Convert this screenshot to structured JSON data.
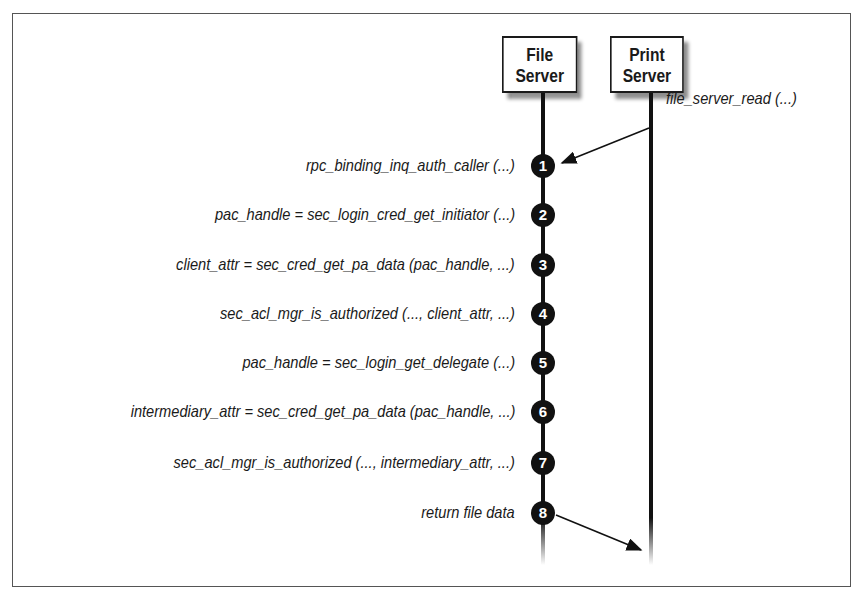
{
  "diagram": {
    "participants": [
      {
        "id": "file_server",
        "line1": "File",
        "line2": "Server"
      },
      {
        "id": "print_server",
        "line1": "Print",
        "line2": "Server"
      }
    ],
    "incoming_message": {
      "label": "file_server_read (...)",
      "from": "print_server",
      "to": "file_server",
      "step": 1
    },
    "steps": [
      {
        "number": "1",
        "label": "rpc_binding_inq_auth_caller (...)"
      },
      {
        "number": "2",
        "label": "pac_handle = sec_login_cred_get_initiator (...)"
      },
      {
        "number": "3",
        "label": "client_attr = sec_cred_get_pa_data (pac_handle, ...)"
      },
      {
        "number": "4",
        "label": "sec_acl_mgr_is_authorized (..., client_attr, ...)"
      },
      {
        "number": "5",
        "label": "pac_handle = sec_login_get_delegate (...)"
      },
      {
        "number": "6",
        "label": "intermediary_attr = sec_cred_get_pa_data (pac_handle, ...)"
      },
      {
        "number": "7",
        "label": "sec_acl_mgr_is_authorized (..., intermediary_attr, ...)"
      },
      {
        "number": "8",
        "label": "return file data"
      }
    ],
    "outgoing_message": {
      "from": "file_server",
      "to": "print_server",
      "step": 8
    }
  }
}
